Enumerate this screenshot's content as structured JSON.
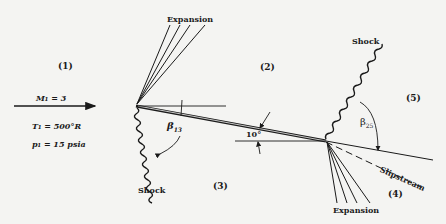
{
  "regions": {
    "r1": "(1)",
    "r2": "(2)",
    "r3": "(3)",
    "r4": "(4)",
    "r5": "(5)"
  },
  "freestream": {
    "mach": "M₁ = 3",
    "temperature": "T₁ = 500°R",
    "pressure": "p₁ = 15 psia"
  },
  "labels": {
    "expansion_top": "Expansion",
    "expansion_bottom": "Expansion",
    "shock_bottom_left": "Shock",
    "shock_top_right": "Shock",
    "slipstream": "Slipstream",
    "angle_of_attack": "10°",
    "beta13": "β",
    "beta13_sub": "13",
    "beta25": "β",
    "beta25_sub": "25"
  },
  "colors": {
    "ink": "#1a1a1a",
    "paper": "#f4f4f2"
  }
}
